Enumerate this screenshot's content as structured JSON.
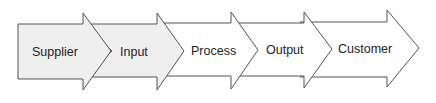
{
  "diagram": {
    "type": "process-flow-chevrons",
    "stages": [
      {
        "label": "Supplier",
        "fill": "#efefef"
      },
      {
        "label": "Input",
        "fill": "#efefef"
      },
      {
        "label": "Process",
        "fill": "#ffffff"
      },
      {
        "label": "Output",
        "fill": "#ffffff"
      },
      {
        "label": "Customer",
        "fill": "#ffffff"
      }
    ],
    "stroke": "#555555"
  }
}
